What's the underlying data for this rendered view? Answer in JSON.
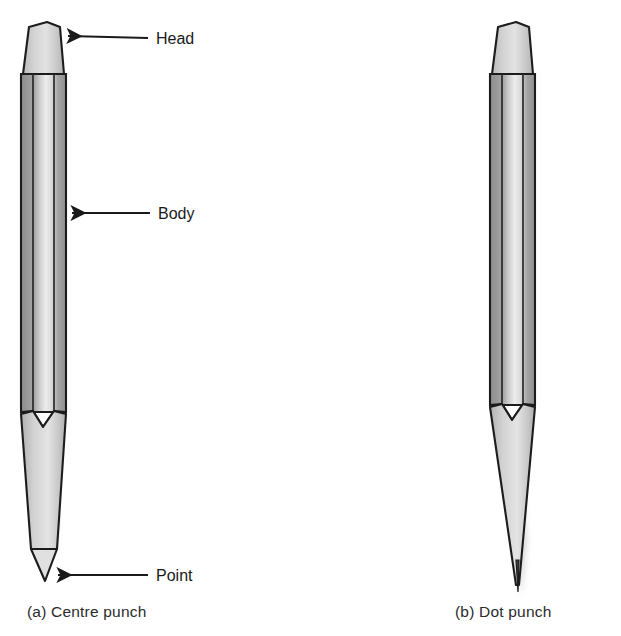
{
  "figure": {
    "background": "#ffffff",
    "ink": "#1a1a1a"
  },
  "labels": {
    "head": "Head",
    "body": "Body",
    "point": "Point"
  },
  "captions": {
    "a": "(a) Centre punch",
    "b": "(b) Dot punch"
  },
  "palette": {
    "outline": "#1c1c1c",
    "shade_dark": "#909090",
    "shade_mid": "#bdbdbd",
    "shade_light": "#ebebeb",
    "taper_fill": "#d8d8d8",
    "head_fill": "#cfcfcf",
    "arrow": "#1a1a1a",
    "caption_text": "#2b2b2b"
  },
  "tools": [
    {
      "id": "centre-punch",
      "name": "Centre punch",
      "parts": [
        "Head",
        "Body",
        "Point"
      ],
      "point_style": "blunt-short-cone",
      "taper_length": "long",
      "labelled": true
    },
    {
      "id": "dot-punch",
      "name": "Dot punch",
      "parts": [
        "Head",
        "Body",
        "Point"
      ],
      "point_style": "sharp-needle",
      "taper_length": "long-slender",
      "labelled": false
    }
  ]
}
